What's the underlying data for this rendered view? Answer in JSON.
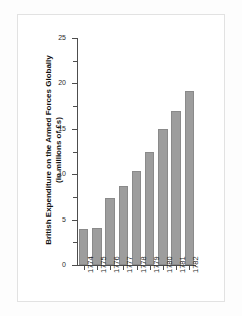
{
  "chart_data": {
    "type": "bar",
    "title": "",
    "xlabel": "",
    "ylabel_line1": "British Expenditure on the Armed Forces Globally",
    "ylabel_line2": "(in millions of £s)",
    "categories": [
      "1774",
      "1775",
      "1776",
      "1777",
      "1778",
      "1779",
      "1780",
      "1781",
      "1782"
    ],
    "values": [
      4.0,
      4.1,
      7.4,
      8.7,
      10.4,
      12.5,
      15.0,
      17.0,
      19.2
    ],
    "ylim": [
      0,
      25
    ],
    "ytick_labels": [
      "0",
      "5",
      "10",
      "15",
      "20",
      "25"
    ],
    "ytick_values": [
      0,
      5,
      10,
      15,
      20,
      25
    ],
    "yminor_ticks": [
      2.5,
      7.5,
      12.5,
      17.5,
      22.5
    ],
    "grid": false,
    "legend": false,
    "bar_color": "#9d9d9d",
    "bar_edge_color": "#8a8a8a",
    "axis_color": "#4d4d4d",
    "background": "#ffffff"
  }
}
